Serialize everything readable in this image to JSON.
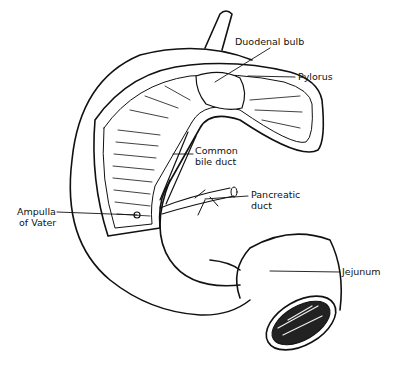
{
  "diagram": {
    "labels": {
      "duodenal_bulb": "Duodenal bulb",
      "pylorus": "Pylorus",
      "common_bile_duct_1": "Common",
      "common_bile_duct_2": "bile duct",
      "pancreatic_duct_1": "Pancreatic",
      "pancreatic_duct_2": "duct",
      "ampulla_1": "Ampulla",
      "ampulla_2": "of Vater",
      "jejunum": "Jejunum"
    },
    "colors": {
      "ink": "#111111",
      "background": "#ffffff"
    }
  }
}
